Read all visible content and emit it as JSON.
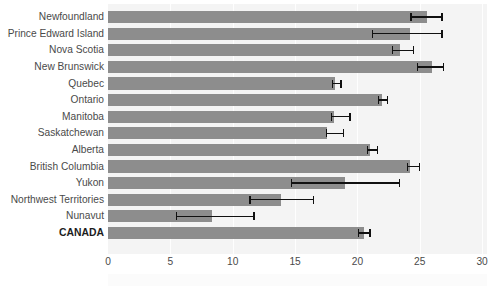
{
  "chart_data": {
    "type": "bar",
    "orientation": "horizontal",
    "title": "",
    "subtitle": "",
    "xlabel": "",
    "ylabel": "",
    "xlim": [
      0,
      30
    ],
    "ylim": null,
    "grid": true,
    "legend": null,
    "xticks": [
      0,
      5,
      10,
      15,
      20,
      25,
      30
    ],
    "xtick_labels": [
      "0",
      "5",
      "10",
      "15",
      "20",
      "25",
      "30"
    ],
    "categories": [
      "Newfoundland",
      "Prince Edward Island",
      "Nova Scotia",
      "New Brunswick",
      "Quebec",
      "Ontario",
      "Manitoba",
      "Saskatchewan",
      "Alberta",
      "British Columbia",
      "Yukon",
      "Northwest Territories",
      "Nunavut",
      "CANADA"
    ],
    "emphasized_categories": [
      "CANADA"
    ],
    "values": [
      25.6,
      24.2,
      23.4,
      26.0,
      18.2,
      22.0,
      18.1,
      17.6,
      21.0,
      24.2,
      19.0,
      13.9,
      8.3,
      20.5
    ],
    "error_low": [
      24.3,
      21.2,
      22.8,
      24.8,
      18.0,
      21.7,
      17.9,
      17.5,
      20.8,
      24.0,
      14.7,
      11.4,
      5.5,
      20.1
    ],
    "error_high": [
      26.8,
      26.8,
      24.5,
      26.9,
      18.7,
      22.4,
      19.4,
      18.9,
      21.6,
      25.0,
      23.4,
      16.5,
      11.7,
      21.0
    ],
    "colors": {
      "bar": "#8d8d8d",
      "error": "#111111",
      "panel_background": "#f4f4f4",
      "gridline": "#ffffff",
      "tick_label": "#4a4a4a",
      "emphasis_label": "#1c1c1c"
    }
  }
}
